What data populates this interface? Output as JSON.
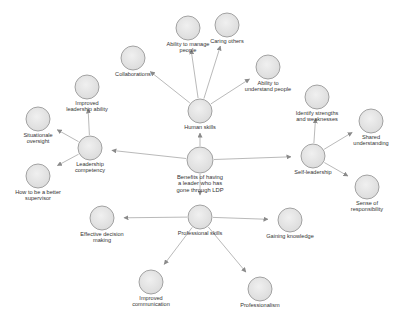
{
  "diagram": {
    "title": "Benefits of having a leader who has gone through LDP",
    "colors": {
      "node_fill": "#e6e6e6",
      "node_stroke": "#9a9a9a",
      "edge": "#9b9b9b",
      "text": "#333333"
    },
    "nodes": [
      {
        "id": "center",
        "label": "Benefits of having\na leader who has\ngone through LDP",
        "x": 200,
        "y": 160,
        "r": 13
      },
      {
        "id": "human",
        "label": "Human skills",
        "x": 200,
        "y": 111,
        "r": 12
      },
      {
        "id": "manage",
        "label": "Ability to manage\npeople",
        "x": 188,
        "y": 28,
        "r": 12
      },
      {
        "id": "caring",
        "label": "Caring others",
        "x": 227,
        "y": 25,
        "r": 12
      },
      {
        "id": "collab",
        "label": "Collaborations",
        "x": 133,
        "y": 58,
        "r": 12
      },
      {
        "id": "understand",
        "label": "Ability to\nunderstand people",
        "x": 268,
        "y": 67,
        "r": 12
      },
      {
        "id": "leadcomp",
        "label": "Leadership\ncompetency",
        "x": 90,
        "y": 148,
        "r": 12
      },
      {
        "id": "improvedlead",
        "label": "Improved\nleadership ability",
        "x": 87,
        "y": 87,
        "r": 12
      },
      {
        "id": "situational",
        "label": "Situationale\noversight",
        "x": 38,
        "y": 119,
        "r": 12
      },
      {
        "id": "supervisor",
        "label": "How to be a better\nsupervisor",
        "x": 38,
        "y": 176,
        "r": 12
      },
      {
        "id": "selflead",
        "label": "Self-leadership",
        "x": 313,
        "y": 156,
        "r": 12
      },
      {
        "id": "strengths",
        "label": "Identify strengths\nand weaknesses",
        "x": 317,
        "y": 97,
        "r": 12
      },
      {
        "id": "shared",
        "label": "Shared\nunderstanding",
        "x": 371,
        "y": 121,
        "r": 12
      },
      {
        "id": "responsibility",
        "label": "Sense of\nresponsibility",
        "x": 367,
        "y": 187,
        "r": 12
      },
      {
        "id": "prof",
        "label": "Professional skills",
        "x": 200,
        "y": 217,
        "r": 12
      },
      {
        "id": "decision",
        "label": "Effective decision\nmaking",
        "x": 102,
        "y": 218,
        "r": 12
      },
      {
        "id": "knowledge",
        "label": "Gaining knowledge",
        "x": 290,
        "y": 220,
        "r": 12
      },
      {
        "id": "communication",
        "label": "Improved\ncommunication",
        "x": 151,
        "y": 282,
        "r": 12
      },
      {
        "id": "professionalism",
        "label": "Professionalism",
        "x": 260,
        "y": 289,
        "r": 12
      }
    ],
    "edges": [
      {
        "from": "center",
        "to": "human"
      },
      {
        "from": "center",
        "to": "leadcomp"
      },
      {
        "from": "center",
        "to": "selflead"
      },
      {
        "from": "center",
        "to": "prof"
      },
      {
        "from": "human",
        "to": "manage"
      },
      {
        "from": "human",
        "to": "caring"
      },
      {
        "from": "human",
        "to": "collab"
      },
      {
        "from": "human",
        "to": "understand"
      },
      {
        "from": "leadcomp",
        "to": "improvedlead"
      },
      {
        "from": "leadcomp",
        "to": "situational"
      },
      {
        "from": "leadcomp",
        "to": "supervisor"
      },
      {
        "from": "selflead",
        "to": "strengths"
      },
      {
        "from": "selflead",
        "to": "shared"
      },
      {
        "from": "selflead",
        "to": "responsibility"
      },
      {
        "from": "prof",
        "to": "decision"
      },
      {
        "from": "prof",
        "to": "knowledge"
      },
      {
        "from": "prof",
        "to": "communication"
      },
      {
        "from": "prof",
        "to": "professionalism"
      }
    ]
  }
}
